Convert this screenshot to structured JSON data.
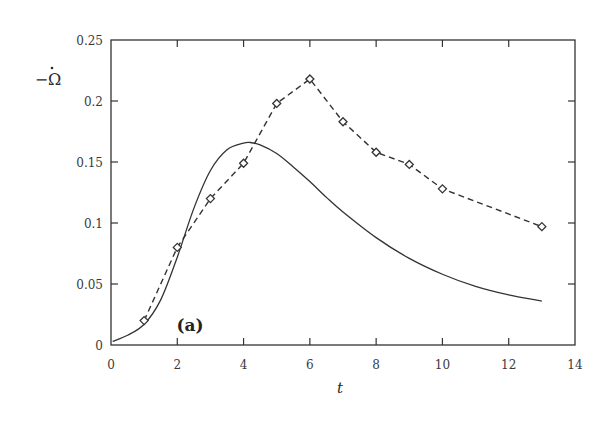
{
  "chart_data": {
    "type": "line",
    "title": "",
    "xlabel": "t",
    "ylabel": "-Ω̇",
    "xlim": [
      0,
      14
    ],
    "ylim": [
      0,
      0.25
    ],
    "xticks": [
      0,
      2,
      4,
      6,
      8,
      10,
      12,
      14
    ],
    "xtick_labels": [
      "0",
      "2",
      "4",
      "6",
      "8",
      "10",
      "12",
      "14"
    ],
    "yticks": [
      0,
      0.05,
      0.1,
      0.15,
      0.2,
      0.25
    ],
    "ytick_labels": [
      "0",
      "0.05",
      "0.1",
      "0.15",
      "0.2",
      "0.25"
    ],
    "grid": false,
    "legend": null,
    "annotations": [
      {
        "text": "(a)",
        "x": 2.0,
        "y": 0.012
      }
    ],
    "series": [
      {
        "name": "model (solid)",
        "style": "solid",
        "color": "#333333",
        "x": [
          0.05,
          0.5,
          1.0,
          1.5,
          2.0,
          2.5,
          3.0,
          3.5,
          4.0,
          4.2,
          4.5,
          5.0,
          5.5,
          6.0,
          6.5,
          7.0,
          8.0,
          9.0,
          10.0,
          11.0,
          12.0,
          13.0
        ],
        "values": [
          0.003,
          0.008,
          0.017,
          0.037,
          0.072,
          0.112,
          0.143,
          0.16,
          0.1655,
          0.166,
          0.164,
          0.157,
          0.146,
          0.134,
          0.121,
          0.109,
          0.088,
          0.071,
          0.058,
          0.048,
          0.041,
          0.036
        ]
      },
      {
        "name": "data (dashed, diamonds)",
        "style": "dashed",
        "marker": "diamond",
        "color": "#333333",
        "x": [
          1,
          2,
          3,
          4,
          5,
          6,
          7,
          8,
          9,
          10,
          13
        ],
        "values": [
          0.02,
          0.08,
          0.12,
          0.149,
          0.198,
          0.218,
          0.183,
          0.158,
          0.148,
          0.128,
          0.097
        ]
      }
    ]
  }
}
